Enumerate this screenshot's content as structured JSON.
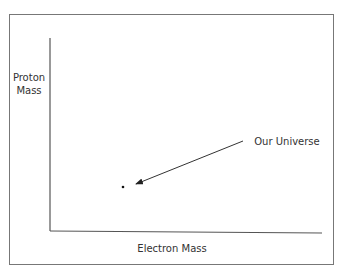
{
  "diagram": {
    "y_axis_label_line1": "Proton",
    "y_axis_label_line2": "Mass",
    "x_axis_label": "Electron Mass",
    "annotation": "Our Universe",
    "colors": {
      "line": "#555555",
      "text": "#333333",
      "point": "#111111"
    }
  }
}
